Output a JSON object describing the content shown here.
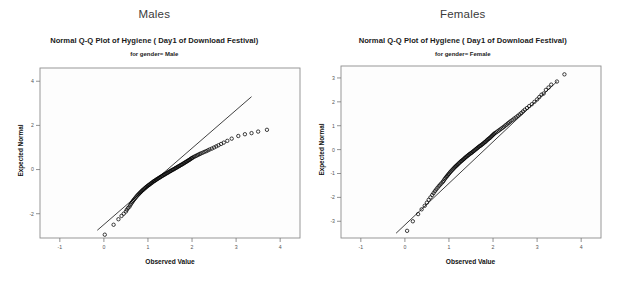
{
  "figure": {
    "width": 617,
    "height": 285,
    "background": "#ffffff"
  },
  "panels": [
    {
      "id": "males-panel",
      "group_header": "Males",
      "chart_data": {
        "type": "scatter",
        "title": "Normal Q-Q Plot of Hygiene ( Day1  of Download Festival)",
        "subtitle": "for gender= Male",
        "xlabel": "Observed Value",
        "ylabel": "Expected Normal",
        "xlim": [
          -1.45,
          4.45
        ],
        "ylim": [
          -3.1,
          4.6
        ],
        "xticks": [
          "-1",
          "0",
          "1",
          "2",
          "3",
          "4"
        ],
        "xtick_values": [
          -1,
          0,
          1,
          2,
          3,
          4
        ],
        "yticks": [
          "4",
          "2",
          "0",
          "-2"
        ],
        "ytick_values": [
          4,
          2,
          0,
          -2
        ],
        "grid": false,
        "legend": "none",
        "marker": "open-circle",
        "reference_line": {
          "x1": -0.15,
          "y1": -2.75,
          "x2": 3.35,
          "y2": 3.3
        },
        "x": [
          0.02,
          0.22,
          0.33,
          0.4,
          0.45,
          0.5,
          0.52,
          0.55,
          0.58,
          0.6,
          0.62,
          0.64,
          0.66,
          0.68,
          0.7,
          0.72,
          0.74,
          0.76,
          0.78,
          0.8,
          0.82,
          0.84,
          0.86,
          0.88,
          0.9,
          0.92,
          0.94,
          0.96,
          0.98,
          1.0,
          1.02,
          1.04,
          1.06,
          1.08,
          1.1,
          1.12,
          1.14,
          1.16,
          1.18,
          1.2,
          1.22,
          1.24,
          1.26,
          1.28,
          1.3,
          1.32,
          1.34,
          1.36,
          1.38,
          1.4,
          1.42,
          1.44,
          1.46,
          1.48,
          1.5,
          1.52,
          1.54,
          1.56,
          1.58,
          1.6,
          1.62,
          1.64,
          1.66,
          1.68,
          1.7,
          1.72,
          1.74,
          1.76,
          1.78,
          1.8,
          1.82,
          1.84,
          1.86,
          1.88,
          1.9,
          1.92,
          1.94,
          1.96,
          1.98,
          2.0,
          2.02,
          2.05,
          2.08,
          2.11,
          2.14,
          2.17,
          2.2,
          2.24,
          2.28,
          2.32,
          2.36,
          2.4,
          2.45,
          2.5,
          2.55,
          2.6,
          2.66,
          2.72,
          2.8,
          2.9,
          3.05,
          3.2,
          3.35,
          3.5,
          3.7
        ],
        "y": [
          -2.95,
          -2.5,
          -2.25,
          -2.1,
          -2.0,
          -1.9,
          -1.82,
          -1.74,
          -1.68,
          -1.6,
          -1.54,
          -1.48,
          -1.42,
          -1.37,
          -1.32,
          -1.27,
          -1.22,
          -1.17,
          -1.13,
          -1.09,
          -1.05,
          -1.01,
          -0.97,
          -0.93,
          -0.9,
          -0.86,
          -0.83,
          -0.79,
          -0.76,
          -0.73,
          -0.7,
          -0.67,
          -0.64,
          -0.61,
          -0.58,
          -0.55,
          -0.52,
          -0.5,
          -0.47,
          -0.44,
          -0.42,
          -0.39,
          -0.37,
          -0.34,
          -0.32,
          -0.29,
          -0.27,
          -0.24,
          -0.22,
          -0.2,
          -0.17,
          -0.15,
          -0.13,
          -0.1,
          -0.08,
          -0.06,
          -0.03,
          -0.01,
          0.01,
          0.03,
          0.06,
          0.08,
          0.1,
          0.13,
          0.15,
          0.17,
          0.2,
          0.22,
          0.24,
          0.27,
          0.29,
          0.32,
          0.34,
          0.37,
          0.39,
          0.42,
          0.44,
          0.47,
          0.5,
          0.52,
          0.55,
          0.58,
          0.61,
          0.64,
          0.67,
          0.7,
          0.73,
          0.76,
          0.8,
          0.83,
          0.87,
          0.91,
          0.95,
          1.0,
          1.05,
          1.1,
          1.16,
          1.22,
          1.3,
          1.4,
          1.52,
          1.6,
          1.65,
          1.72,
          1.8
        ]
      }
    },
    {
      "id": "females-panel",
      "group_header": "Females",
      "chart_data": {
        "type": "scatter",
        "title": "Normal Q-Q Plot of Hygiene ( Day1  of Download Festival)",
        "subtitle": "for gender= Female",
        "xlabel": "Observed Value",
        "ylabel": "Expected Normal",
        "xlim": [
          -1.45,
          4.45
        ],
        "ylim": [
          -3.7,
          3.5
        ],
        "xticks": [
          "-1",
          "0",
          "1",
          "2",
          "3",
          "4"
        ],
        "xtick_values": [
          -1,
          0,
          1,
          2,
          3,
          4
        ],
        "yticks": [
          "3",
          "2",
          "1",
          "0",
          "-1",
          "-2",
          "-3"
        ],
        "ytick_values": [
          3,
          2,
          1,
          0,
          -1,
          -2,
          -3
        ],
        "grid": false,
        "legend": "none",
        "marker": "open-circle",
        "reference_line": {
          "x1": -0.2,
          "y1": -3.5,
          "x2": 3.45,
          "y2": 2.85
        },
        "x": [
          0.05,
          0.18,
          0.3,
          0.38,
          0.45,
          0.5,
          0.54,
          0.58,
          0.62,
          0.65,
          0.68,
          0.71,
          0.74,
          0.77,
          0.8,
          0.83,
          0.86,
          0.88,
          0.9,
          0.92,
          0.94,
          0.96,
          0.98,
          1.0,
          1.02,
          1.04,
          1.06,
          1.08,
          1.1,
          1.12,
          1.14,
          1.16,
          1.18,
          1.2,
          1.22,
          1.24,
          1.26,
          1.28,
          1.3,
          1.32,
          1.34,
          1.36,
          1.38,
          1.4,
          1.42,
          1.44,
          1.46,
          1.48,
          1.5,
          1.52,
          1.54,
          1.56,
          1.58,
          1.6,
          1.62,
          1.64,
          1.66,
          1.68,
          1.7,
          1.72,
          1.74,
          1.76,
          1.78,
          1.8,
          1.82,
          1.84,
          1.86,
          1.88,
          1.9,
          1.92,
          1.94,
          1.96,
          1.98,
          2.0,
          2.02,
          2.04,
          2.07,
          2.1,
          2.13,
          2.16,
          2.19,
          2.22,
          2.25,
          2.28,
          2.31,
          2.34,
          2.37,
          2.4,
          2.44,
          2.48,
          2.52,
          2.56,
          2.6,
          2.64,
          2.68,
          2.72,
          2.77,
          2.82,
          2.88,
          2.94,
          3.0,
          3.05,
          3.1,
          3.15,
          3.2,
          3.26,
          3.32,
          3.45,
          3.62
        ],
        "y": [
          -3.4,
          -3.0,
          -2.7,
          -2.5,
          -2.35,
          -2.22,
          -2.1,
          -2.0,
          -1.9,
          -1.82,
          -1.74,
          -1.67,
          -1.6,
          -1.53,
          -1.47,
          -1.41,
          -1.35,
          -1.3,
          -1.24,
          -1.19,
          -1.14,
          -1.1,
          -1.05,
          -1.01,
          -0.96,
          -0.92,
          -0.88,
          -0.84,
          -0.8,
          -0.76,
          -0.72,
          -0.69,
          -0.65,
          -0.62,
          -0.58,
          -0.55,
          -0.51,
          -0.48,
          -0.45,
          -0.42,
          -0.39,
          -0.35,
          -0.32,
          -0.29,
          -0.26,
          -0.23,
          -0.2,
          -0.17,
          -0.15,
          -0.12,
          -0.09,
          -0.06,
          -0.03,
          0.0,
          0.03,
          0.06,
          0.09,
          0.12,
          0.15,
          0.17,
          0.2,
          0.23,
          0.26,
          0.29,
          0.32,
          0.35,
          0.39,
          0.42,
          0.45,
          0.48,
          0.51,
          0.55,
          0.58,
          0.62,
          0.65,
          0.69,
          0.72,
          0.76,
          0.8,
          0.84,
          0.88,
          0.92,
          0.96,
          1.01,
          1.05,
          1.1,
          1.14,
          1.19,
          1.24,
          1.3,
          1.35,
          1.41,
          1.47,
          1.53,
          1.6,
          1.67,
          1.74,
          1.82,
          1.9,
          2.0,
          2.1,
          2.2,
          2.3,
          2.35,
          2.5,
          2.6,
          2.72,
          2.85,
          3.15
        ]
      }
    }
  ]
}
